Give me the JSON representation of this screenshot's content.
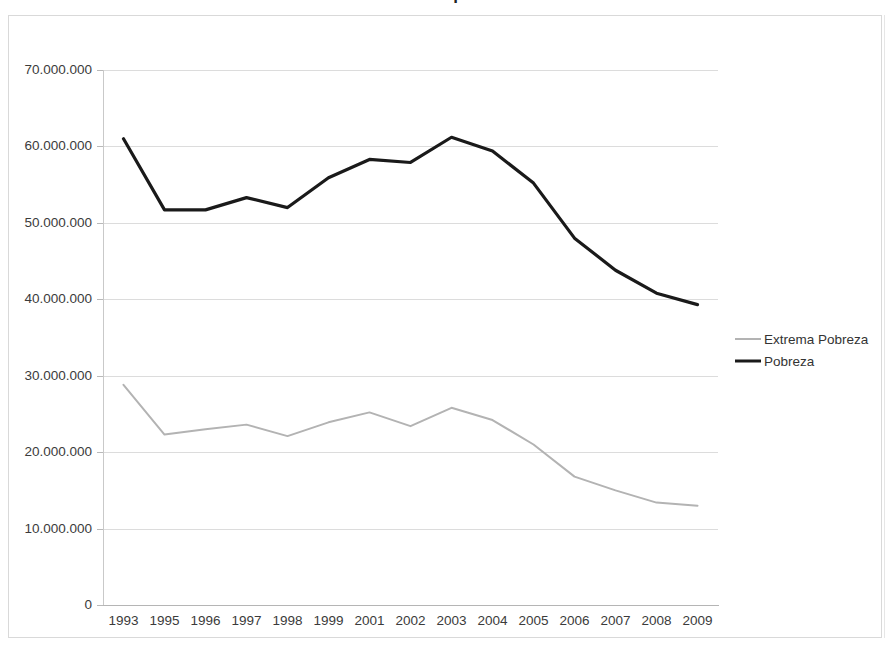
{
  "chart_data": {
    "type": "line",
    "title": "Pobreza e extrema pobreza no Brasil",
    "xlabel": "",
    "ylabel": "",
    "categories": [
      "1993",
      "1995",
      "1996",
      "1997",
      "1998",
      "1999",
      "2001",
      "2002",
      "2003",
      "2004",
      "2005",
      "2006",
      "2007",
      "2008",
      "2009"
    ],
    "series": [
      {
        "name": "Extrema Pobreza",
        "color": "#b3b3b3",
        "values": [
          28800000,
          22300000,
          23000000,
          23600000,
          22100000,
          23900000,
          25200000,
          23400000,
          25800000,
          24200000,
          21000000,
          16800000,
          15000000,
          13400000,
          13000000
        ]
      },
      {
        "name": "Pobreza",
        "color": "#1a1a1a",
        "values": [
          61000000,
          51700000,
          51700000,
          53300000,
          52000000,
          55900000,
          58300000,
          57900000,
          61200000,
          59400000,
          55200000,
          48000000,
          43800000,
          40800000,
          39300000
        ]
      }
    ],
    "ylim": [
      0,
      70000000
    ],
    "ytick_values": [
      0,
      10000000,
      20000000,
      30000000,
      40000000,
      50000000,
      60000000,
      70000000
    ],
    "ytick_labels": [
      "0",
      "10.000.000",
      "20.000.000",
      "30.000.000",
      "40.000.000",
      "50.000.000",
      "60.000.000",
      "70.000.000"
    ],
    "grid": true,
    "legend_position": "right"
  },
  "legend": {
    "items": [
      {
        "label": "Extrema Pobreza",
        "swatch": "extrema"
      },
      {
        "label": "Pobreza",
        "swatch": "pobreza"
      }
    ]
  }
}
